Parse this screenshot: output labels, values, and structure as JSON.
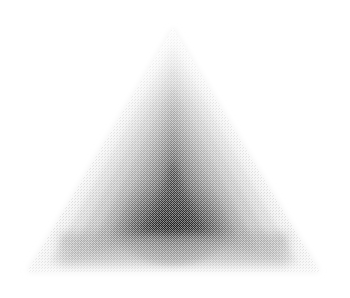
{
  "canvas": {
    "width": 350,
    "height": 298,
    "background_color": "#ffffff",
    "title": "Nested Triangle Gradient",
    "alt_text": "Grayscale dithered triangle with nested inner triangles darkening toward the center on a white background"
  },
  "figure": {
    "name": "nested-triangle-gradient",
    "shape_type": "triangle",
    "render_style": "dithered-halftone",
    "symmetry": "vertical-axis",
    "axis_x": 173,
    "outer_triangle": {
      "apex": {
        "x": 173,
        "y": 28
      },
      "bottom_left": {
        "x": 27,
        "y": 272
      },
      "bottom_right": {
        "x": 320,
        "y": 272
      },
      "edge_color": "#f2f2f2"
    },
    "palette": {
      "background": "#ffffff",
      "lightest": "#f4f4f4",
      "light": "#d8d8d8",
      "mid_light": "#b4b4b4",
      "mid": "#8c8c8c",
      "mid_dark": "#636363",
      "dark": "#3c3c3c",
      "darkest": "#1e1e1e"
    },
    "layers": [
      {
        "label": "outer-rim",
        "apex": {
          "x": 173,
          "y": 28
        },
        "bottom_left": {
          "x": 27,
          "y": 272
        },
        "bottom_right": {
          "x": 320,
          "y": 272
        },
        "fill": "#f2f2f2",
        "opacity": 1
      },
      {
        "label": "ring-1",
        "apex": {
          "x": 173,
          "y": 46
        },
        "bottom_left": {
          "x": 48,
          "y": 264
        },
        "bottom_right": {
          "x": 299,
          "y": 264
        },
        "fill": "#dadada",
        "opacity": 1
      },
      {
        "label": "ring-2",
        "apex": {
          "x": 173,
          "y": 64
        },
        "bottom_left": {
          "x": 68,
          "y": 258
        },
        "bottom_right": {
          "x": 279,
          "y": 258
        },
        "fill": "#c2c2c2",
        "opacity": 1
      },
      {
        "label": "ring-3",
        "apex": {
          "x": 173,
          "y": 84
        },
        "bottom_left": {
          "x": 88,
          "y": 252
        },
        "bottom_right": {
          "x": 259,
          "y": 252
        },
        "fill": "#a8a8a8",
        "opacity": 1
      },
      {
        "label": "ring-4",
        "apex": {
          "x": 173,
          "y": 104
        },
        "bottom_left": {
          "x": 106,
          "y": 246
        },
        "bottom_right": {
          "x": 241,
          "y": 246
        },
        "fill": "#8e8e8e",
        "opacity": 1
      },
      {
        "label": "ring-5",
        "apex": {
          "x": 173,
          "y": 124
        },
        "bottom_left": {
          "x": 120,
          "y": 242
        },
        "bottom_right": {
          "x": 227,
          "y": 242
        },
        "fill": "#757575",
        "opacity": 1
      },
      {
        "label": "ring-6",
        "apex": {
          "x": 173,
          "y": 142
        },
        "bottom_left": {
          "x": 133,
          "y": 238
        },
        "bottom_right": {
          "x": 214,
          "y": 238
        },
        "fill": "#5c5c5c",
        "opacity": 1
      },
      {
        "label": "core",
        "apex": {
          "x": 173,
          "y": 158
        },
        "bottom_left": {
          "x": 143,
          "y": 234
        },
        "bottom_right": {
          "x": 204,
          "y": 234
        },
        "fill": "#303030",
        "opacity": 1
      },
      {
        "label": "core-center",
        "apex": {
          "x": 173,
          "y": 176
        },
        "bottom_left": {
          "x": 154,
          "y": 226
        },
        "bottom_right": {
          "x": 193,
          "y": 226
        },
        "fill": "#1e1e1e",
        "opacity": 1
      }
    ],
    "inner_shadow_band": {
      "label": "lower-shadow-band",
      "top_y": 234,
      "bottom_y": 266,
      "left_x": 60,
      "right_x": 288,
      "fill": "#9a9a9a"
    },
    "texture": {
      "label": "dither-noise",
      "pattern": "checker-stipple",
      "cell_size_px": 2,
      "strength": 0.42
    },
    "blur_px": 3.5
  },
  "measurements": {
    "outer_width_px": 293,
    "outer_height_px": 244,
    "darkest_point": {
      "x": 173,
      "y": 205
    },
    "darkest_value_hex": "#1e1e1e"
  }
}
